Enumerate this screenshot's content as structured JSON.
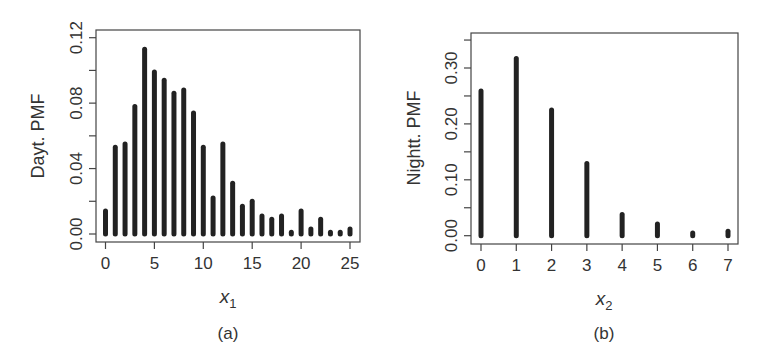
{
  "chart_data": [
    {
      "type": "bar",
      "panel_label": "(a)",
      "title": "",
      "xlabel": "x",
      "xlabel_subscript": "1",
      "ylabel": "Dayt. PMF",
      "x": [
        0,
        1,
        2,
        3,
        4,
        5,
        6,
        7,
        8,
        9,
        10,
        11,
        12,
        13,
        14,
        15,
        16,
        17,
        18,
        19,
        20,
        21,
        22,
        23,
        24,
        25
      ],
      "values": [
        0.014,
        0.053,
        0.055,
        0.078,
        0.113,
        0.099,
        0.094,
        0.086,
        0.088,
        0.074,
        0.053,
        0.022,
        0.055,
        0.031,
        0.017,
        0.02,
        0.011,
        0.009,
        0.011,
        0.001,
        0.014,
        0.003,
        0.009,
        0.001,
        0.001,
        0.003
      ],
      "xticks": [
        "0",
        "5",
        "10",
        "15",
        "20",
        "25"
      ],
      "yticks": [
        "0.00",
        "0.04",
        "0.08",
        "0.12"
      ],
      "xlim": [
        -1,
        26
      ],
      "ylim": [
        0,
        0.12
      ],
      "grid": false,
      "legend": null
    },
    {
      "type": "bar",
      "panel_label": "(b)",
      "title": "",
      "xlabel": "x",
      "xlabel_subscript": "2",
      "ylabel": "Nightt. PMF",
      "x": [
        0,
        1,
        2,
        3,
        4,
        5,
        6,
        7
      ],
      "values": [
        0.259,
        0.317,
        0.225,
        0.129,
        0.038,
        0.021,
        0.005,
        0.008
      ],
      "xticks": [
        "0",
        "1",
        "2",
        "3",
        "4",
        "5",
        "6",
        "7"
      ],
      "yticks": [
        "0.00",
        "0.10",
        "0.20",
        "0.30"
      ],
      "xlim": [
        -0.25,
        7.25
      ],
      "ylim": [
        0,
        0.35
      ],
      "grid": false,
      "legend": null
    }
  ]
}
